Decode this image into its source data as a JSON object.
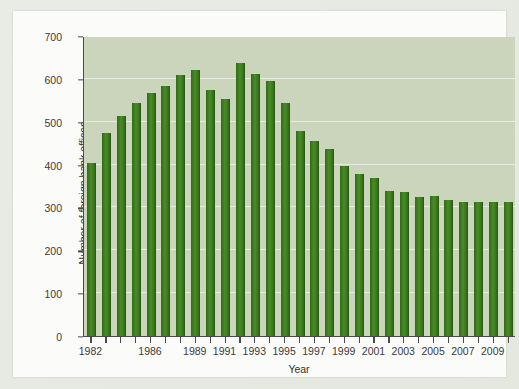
{
  "chart_data": {
    "type": "bar",
    "title": "",
    "subtitle": "",
    "xlabel": "Year",
    "ylabel": "Number of foreign bank offices",
    "categories": [
      1982,
      1983,
      1984,
      1985,
      1986,
      1987,
      1988,
      1989,
      1990,
      1991,
      1992,
      1993,
      1994,
      1995,
      1996,
      1997,
      1998,
      1999,
      2000,
      2001,
      2002,
      2003,
      2004,
      2005,
      2006,
      2007,
      2008,
      2009,
      2010
    ],
    "values": [
      404,
      473,
      513,
      543,
      568,
      584,
      610,
      620,
      574,
      553,
      637,
      612,
      594,
      543,
      478,
      455,
      436,
      396,
      379,
      369,
      338,
      337,
      325,
      326,
      318,
      313,
      313,
      313,
      313
    ],
    "series": [
      {
        "name": "Number of foreign bank offices",
        "values": [
          404,
          473,
          513,
          543,
          568,
          584,
          610,
          620,
          574,
          553,
          637,
          612,
          594,
          543,
          478,
          455,
          436,
          396,
          379,
          369,
          338,
          337,
          325,
          326,
          318,
          313,
          313,
          313,
          313
        ]
      }
    ],
    "ylim": [
      0,
      700
    ],
    "yticks": [
      0,
      100,
      200,
      300,
      400,
      500,
      600,
      700
    ],
    "ytick_labels": [
      "0",
      "100",
      "200",
      "300",
      "400",
      "500",
      "600",
      "700"
    ],
    "xtick_years": [
      1982,
      1986,
      1989,
      1991,
      1993,
      1995,
      1997,
      1999,
      2001,
      2003,
      2005,
      2007,
      2009
    ],
    "xtick_labels": [
      "1982",
      "1986",
      "1989",
      "1991",
      "1993",
      "1995",
      "1997",
      "1999",
      "2001",
      "2003",
      "2005",
      "2007",
      "2009"
    ],
    "grid": true,
    "grid_axis": "y",
    "legend": false,
    "legend_position": "none",
    "bar_color": "#3d7d1f",
    "plot_background": "#cbd5bb",
    "axis_color": "#4a4a4a",
    "gridline_color": "#ffffff",
    "page_background": "#e8ebe4",
    "card_background": "#fbfbf9"
  }
}
